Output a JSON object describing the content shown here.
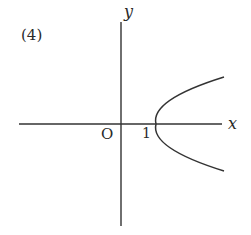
{
  "figure": {
    "panel_label": "(4)",
    "axes": {
      "x_label": "x",
      "y_label": "y",
      "origin_label": "O"
    },
    "annotations": {
      "vertex_tick_label": "1"
    },
    "curve": {
      "type": "parabola",
      "opens": "right",
      "vertex": [
        1,
        0
      ],
      "description": "Rightward-opening parabola with vertex at (1, 0)"
    },
    "colors": {
      "ink": "#2a2a2a",
      "background": "#ffffff"
    }
  }
}
